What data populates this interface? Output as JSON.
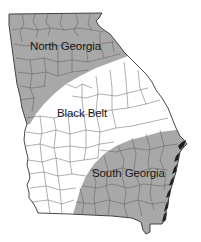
{
  "map": {
    "title": "Georgia regions",
    "colors": {
      "shaded_region": "#a9a9a9",
      "unshaded_region": "#ffffff",
      "county_lines": "#555555",
      "outline": "#333333",
      "label_text": "#1a1a1a"
    },
    "regions": [
      {
        "id": "north-georgia",
        "label": "North Georgia",
        "shaded": true
      },
      {
        "id": "black-belt",
        "label": "Black Belt",
        "shaded": false
      },
      {
        "id": "south-georgia",
        "label": "South Georgia",
        "shaded": true
      }
    ]
  }
}
